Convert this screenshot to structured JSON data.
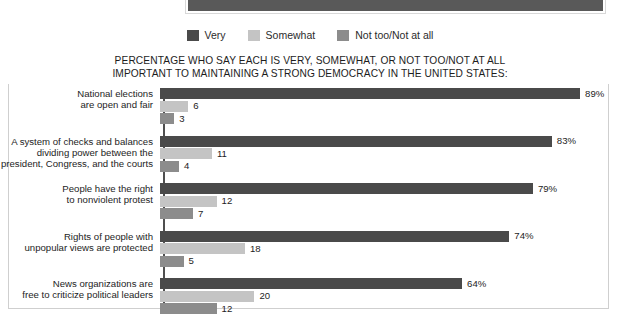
{
  "banner": {
    "name": "cropped-dark-header-band",
    "color": "#595959"
  },
  "legend": {
    "position": "top-center",
    "items": [
      {
        "label": "Very",
        "color": "#4a4a4a",
        "icon": "legend-swatch-icon"
      },
      {
        "label": "Somewhat",
        "color": "#c4c4c4",
        "icon": "legend-swatch-icon"
      },
      {
        "label": "Not too/Not at all",
        "color": "#8c8c8c",
        "icon": "legend-swatch-icon"
      }
    ]
  },
  "title": {
    "line1": "PERCENTAGE WHO SAY EACH IS VERY, SOMEWHAT, OR NOT TOO/NOT AT ALL",
    "line2": "IMPORTANT TO MAINTAINING A STRONG DEMOCRACY IN THE UNITED STATES:"
  },
  "chart_data": {
    "type": "bar",
    "orientation": "horizontal",
    "title": "PERCENTAGE WHO SAY EACH IS VERY, SOMEWHAT, OR NOT TOO/NOT AT ALL IMPORTANT TO MAINTAINING A STRONG DEMOCRACY IN THE UNITED STATES:",
    "xlabel": "",
    "ylabel": "",
    "xlim": [
      0,
      100
    ],
    "grid": false,
    "legend_position": "top-center",
    "categories": [
      "National elections are open and fair",
      "A system of checks and balances dividing power between the president, Congress, and the courts",
      "People have the right to nonviolent protest",
      "Rights of people with unpopular views are protected",
      "News organizations are free to criticize political leaders"
    ],
    "series": [
      {
        "name": "Very",
        "color": "#4a4a4a",
        "values": [
          89,
          83,
          79,
          74,
          64
        ]
      },
      {
        "name": "Somewhat",
        "color": "#c4c4c4",
        "values": [
          6,
          11,
          12,
          18,
          20
        ]
      },
      {
        "name": "Not too/Not at all",
        "color": "#8c8c8c",
        "values": [
          3,
          4,
          7,
          5,
          12
        ]
      }
    ],
    "data_labels": [
      {
        "category_index": 0,
        "values": [
          "89%",
          "6",
          "3"
        ]
      },
      {
        "category_index": 1,
        "values": [
          "83%",
          "11",
          "4"
        ]
      },
      {
        "category_index": 2,
        "values": [
          "79%",
          "12",
          "7"
        ]
      },
      {
        "category_index": 3,
        "values": [
          "74%",
          "18",
          "5"
        ]
      },
      {
        "category_index": 4,
        "values": [
          "64%",
          "20",
          "12"
        ]
      }
    ]
  },
  "groups": [
    {
      "label_lines": [
        "National elections",
        "are open and fair"
      ],
      "bars": [
        {
          "series": "Very",
          "value": 89,
          "label": "89%",
          "color": "#4a4a4a"
        },
        {
          "series": "Somewhat",
          "value": 6,
          "label": "6",
          "color": "#c4c4c4"
        },
        {
          "series": "Not too/Not at all",
          "value": 3,
          "label": "3",
          "color": "#8c8c8c"
        }
      ]
    },
    {
      "label_lines": [
        "A system of checks and balances",
        "dividing power between the",
        "president, Congress, and the courts"
      ],
      "bars": [
        {
          "series": "Very",
          "value": 83,
          "label": "83%",
          "color": "#4a4a4a"
        },
        {
          "series": "Somewhat",
          "value": 11,
          "label": "11",
          "color": "#c4c4c4"
        },
        {
          "series": "Not too/Not at all",
          "value": 4,
          "label": "4",
          "color": "#8c8c8c"
        }
      ]
    },
    {
      "label_lines": [
        "People have the right",
        "to nonviolent protest"
      ],
      "bars": [
        {
          "series": "Very",
          "value": 79,
          "label": "79%",
          "color": "#4a4a4a"
        },
        {
          "series": "Somewhat",
          "value": 12,
          "label": "12",
          "color": "#c4c4c4"
        },
        {
          "series": "Not too/Not at all",
          "value": 7,
          "label": "7",
          "color": "#8c8c8c"
        }
      ]
    },
    {
      "label_lines": [
        "Rights of people with",
        "unpopular views are protected"
      ],
      "bars": [
        {
          "series": "Very",
          "value": 74,
          "label": "74%",
          "color": "#4a4a4a"
        },
        {
          "series": "Somewhat",
          "value": 18,
          "label": "18",
          "color": "#c4c4c4"
        },
        {
          "series": "Not too/Not at all",
          "value": 5,
          "label": "5",
          "color": "#8c8c8c"
        }
      ]
    },
    {
      "label_lines": [
        "News organizations are",
        "free to criticize political leaders"
      ],
      "bars": [
        {
          "series": "Very",
          "value": 64,
          "label": "64%",
          "color": "#4a4a4a"
        },
        {
          "series": "Somewhat",
          "value": 20,
          "label": "20",
          "color": "#c4c4c4"
        },
        {
          "series": "Not too/Not at all",
          "value": 12,
          "label": "12",
          "color": "#8c8c8c"
        }
      ]
    }
  ]
}
